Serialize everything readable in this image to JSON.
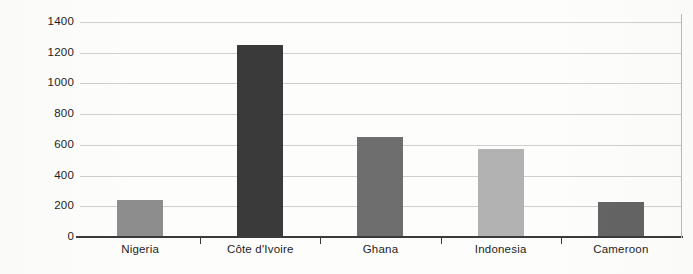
{
  "chart_data": {
    "type": "bar",
    "title": "",
    "subtitle": "",
    "xlabel": "",
    "ylabel": "",
    "categories": [
      "Nigeria",
      "Côte d'Ivoire",
      "Ghana",
      "Indonesia",
      "Cameroon"
    ],
    "values": [
      240,
      1250,
      650,
      570,
      230
    ],
    "ylim": [
      0,
      1400
    ],
    "ytick_labels": [
      "0",
      "200",
      "400",
      "600",
      "800",
      "1000",
      "1200",
      "1400"
    ],
    "ytick_values": [
      0,
      200,
      400,
      600,
      800,
      1000,
      1200,
      1400
    ],
    "grid": true,
    "legend": "none",
    "bar_colors": [
      "#8d8d8d",
      "#3a3a3a",
      "#6e6e6e",
      "#b2b2b2",
      "#646464"
    ],
    "axis_color": "#3a3a3a",
    "gridline_color": "#cfcfcf",
    "background_color": "#fdfdfb",
    "text_color": "#1d1d1d"
  }
}
